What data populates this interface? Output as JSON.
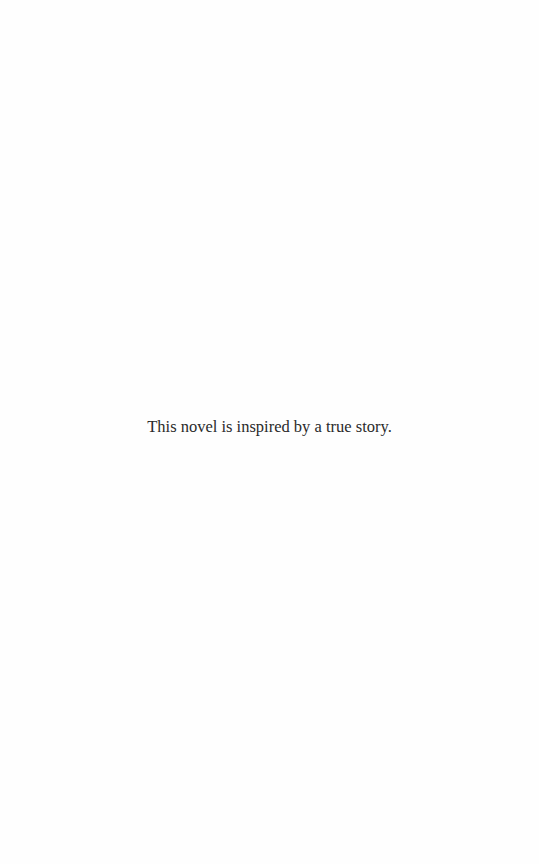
{
  "page": {
    "epigraph": "This novel is inspired by a true story."
  },
  "colors": {
    "background": "#fefefe",
    "text": "#2a2a2a"
  }
}
